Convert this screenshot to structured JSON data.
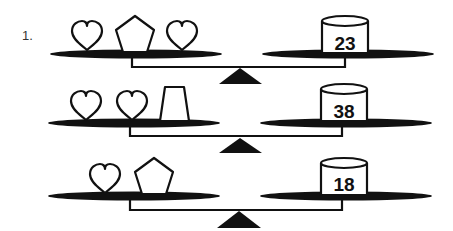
{
  "problem": {
    "number_label": "1.",
    "balances": [
      {
        "left_items": [
          "heart",
          "pentagon",
          "heart"
        ],
        "right_weight": "23"
      },
      {
        "left_items": [
          "heart",
          "heart",
          "trapezoid"
        ],
        "right_weight": "38"
      },
      {
        "left_items": [
          "heart",
          "pentagon"
        ],
        "right_weight": "18"
      }
    ]
  },
  "colors": {
    "ink": "#111111",
    "background": "#ffffff"
  }
}
